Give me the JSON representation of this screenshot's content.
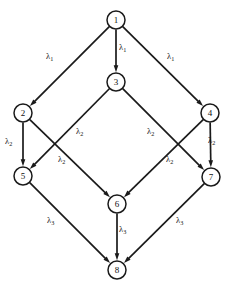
{
  "figure": {
    "type": "directed-graph",
    "background_color": "#ffffff",
    "line_color": "#1a1a1a",
    "text_color": "#111111"
  },
  "nodes": [
    {
      "id": "1",
      "label": "1",
      "cx": 116,
      "cy": 20,
      "r": 9
    },
    {
      "id": "2",
      "label": "2",
      "cx": 23,
      "cy": 113,
      "r": 9
    },
    {
      "id": "3",
      "label": "3",
      "cx": 116,
      "cy": 82,
      "r": 9
    },
    {
      "id": "4",
      "label": "4",
      "cx": 210,
      "cy": 113,
      "r": 9
    },
    {
      "id": "5",
      "label": "5",
      "cx": 23,
      "cy": 176,
      "r": 9
    },
    {
      "id": "6",
      "label": "6",
      "cx": 117,
      "cy": 204,
      "r": 9
    },
    {
      "id": "7",
      "label": "7",
      "cx": 211,
      "cy": 177,
      "r": 9
    },
    {
      "id": "8",
      "label": "8",
      "cx": 117,
      "cy": 270,
      "r": 9
    }
  ],
  "edges": [
    {
      "id": "e1-2",
      "from": "1",
      "to": "2",
      "label": "λ",
      "sub": "1"
    },
    {
      "id": "e1-3",
      "from": "1",
      "to": "3",
      "label": "λ",
      "sub": "1"
    },
    {
      "id": "e1-4",
      "from": "1",
      "to": "4",
      "label": "λ",
      "sub": "1"
    },
    {
      "id": "e2-5",
      "from": "2",
      "to": "5",
      "label": "λ",
      "sub": "2"
    },
    {
      "id": "e2-6",
      "from": "2",
      "to": "6",
      "label": "λ",
      "sub": "2"
    },
    {
      "id": "e3-5",
      "from": "3",
      "to": "5",
      "label": "λ",
      "sub": "2"
    },
    {
      "id": "e3-7",
      "from": "3",
      "to": "7",
      "label": "λ",
      "sub": "2"
    },
    {
      "id": "e4-6",
      "from": "4",
      "to": "6",
      "label": "λ",
      "sub": "2"
    },
    {
      "id": "e4-7",
      "from": "4",
      "to": "7",
      "label": "λ",
      "sub": "2"
    },
    {
      "id": "e5-8",
      "from": "5",
      "to": "8",
      "label": "λ",
      "sub": "3"
    },
    {
      "id": "e6-8",
      "from": "6",
      "to": "8",
      "label": "λ",
      "sub": "3"
    },
    {
      "id": "e7-8",
      "from": "7",
      "to": "8",
      "label": "λ",
      "sub": "3"
    }
  ],
  "edge_labels": [
    {
      "id": "lbl-1-2",
      "edge": "e1-2",
      "text": "λ",
      "sub": "1",
      "x": 46,
      "y": 52
    },
    {
      "id": "lbl-1-3",
      "edge": "e1-3",
      "text": "λ",
      "sub": "1",
      "x": 119,
      "y": 43
    },
    {
      "id": "lbl-1-4",
      "edge": "e1-4",
      "text": "λ",
      "sub": "1",
      "x": 167,
      "y": 52
    },
    {
      "id": "lbl-2-5",
      "edge": "e2-5",
      "text": "λ",
      "sub": "2",
      "x": 5,
      "y": 137
    },
    {
      "id": "lbl-3-5",
      "edge": "e3-5",
      "text": "λ",
      "sub": "2",
      "x": 76,
      "y": 127
    },
    {
      "id": "lbl-2-6",
      "edge": "e2-6",
      "text": "λ",
      "sub": "2",
      "x": 58,
      "y": 155
    },
    {
      "id": "lbl-3-7",
      "edge": "e3-7",
      "text": "λ",
      "sub": "2",
      "x": 147,
      "y": 127
    },
    {
      "id": "lbl-4-6",
      "edge": "e4-6",
      "text": "λ",
      "sub": "2",
      "x": 166,
      "y": 155
    },
    {
      "id": "lbl-4-7",
      "edge": "e4-7",
      "text": "λ",
      "sub": "2",
      "x": 208,
      "y": 136
    },
    {
      "id": "lbl-5-8",
      "edge": "e5-8",
      "text": "λ",
      "sub": "3",
      "x": 47,
      "y": 216
    },
    {
      "id": "lbl-6-8",
      "edge": "e6-8",
      "text": "λ",
      "sub": "3",
      "x": 119,
      "y": 225
    },
    {
      "id": "lbl-7-8",
      "edge": "e7-8",
      "text": "λ",
      "sub": "3",
      "x": 176,
      "y": 216
    }
  ]
}
